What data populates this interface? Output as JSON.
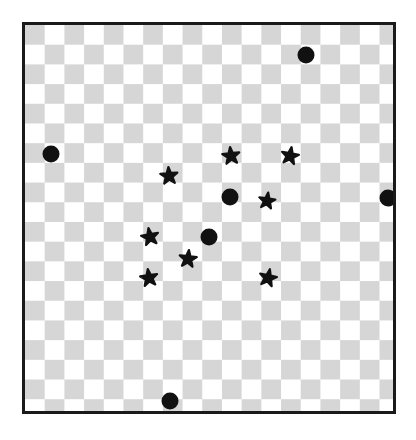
{
  "canvas": {
    "width": 416,
    "height": 440,
    "background_color": "#ffffff"
  },
  "board": {
    "label": "Checkerboard panel",
    "left": 22,
    "top": 22,
    "width": 374,
    "height": 392,
    "border_color": "#1a1a1a",
    "border_width": 3,
    "checker": {
      "cell_size": 19.7,
      "light_color": "#ffffff",
      "dark_color": "#d6d6d6",
      "columns": 19,
      "rows": 20,
      "parity_offset": 1
    }
  },
  "shapes": {
    "circle_color": "#111111",
    "star_color": "#111111",
    "circle_count": 6,
    "star_count": 8,
    "circles": [
      {
        "id": "circle-1",
        "cx": 306,
        "cy": 55,
        "r": 8.5
      },
      {
        "id": "circle-2",
        "cx": 51,
        "cy": 154,
        "r": 8.5
      },
      {
        "id": "circle-3",
        "cx": 230,
        "cy": 197,
        "r": 8.5
      },
      {
        "id": "circle-4",
        "cx": 388,
        "cy": 198,
        "r": 8.5
      },
      {
        "id": "circle-5",
        "cx": 209,
        "cy": 237,
        "r": 8.5
      },
      {
        "id": "circle-6",
        "cx": 170,
        "cy": 401,
        "r": 8.5
      }
    ],
    "stars": [
      {
        "id": "star-1",
        "cx": 231,
        "cy": 156,
        "size": 18,
        "rotation": -6
      },
      {
        "id": "star-2",
        "cx": 290,
        "cy": 156,
        "size": 18,
        "rotation": 10
      },
      {
        "id": "star-3",
        "cx": 169,
        "cy": 176,
        "size": 18,
        "rotation": -4
      },
      {
        "id": "star-4",
        "cx": 267,
        "cy": 201,
        "size": 17,
        "rotation": 8
      },
      {
        "id": "star-5",
        "cx": 150,
        "cy": 237,
        "size": 18,
        "rotation": -10
      },
      {
        "id": "star-6",
        "cx": 188,
        "cy": 259,
        "size": 18,
        "rotation": 6
      },
      {
        "id": "star-7",
        "cx": 149,
        "cy": 278,
        "size": 18,
        "rotation": -8
      },
      {
        "id": "star-8",
        "cx": 268,
        "cy": 278,
        "size": 18,
        "rotation": 12
      }
    ]
  }
}
